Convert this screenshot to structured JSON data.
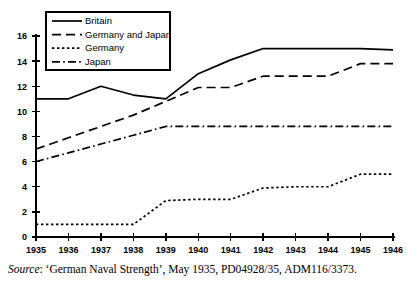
{
  "caption": {
    "source_word": "Source",
    "source_rest": ": ‘German Naval Strength’, May 1935, PD04928/35, ADM116/3373."
  },
  "legend": {
    "position": "top-left-inside",
    "entries": [
      {
        "label": "Britain",
        "style": "solid"
      },
      {
        "label": "Germany and Japan",
        "style": "dashed"
      },
      {
        "label": "Germany",
        "style": "dotted"
      },
      {
        "label": "Japan",
        "style": "dash-dot"
      }
    ]
  },
  "chart_data": {
    "type": "line",
    "title": "",
    "xlabel": "",
    "ylabel": "",
    "grid": false,
    "legend_position": "upper left",
    "x": [
      1935,
      1936,
      1937,
      1938,
      1939,
      1940,
      1941,
      1942,
      1943,
      1944,
      1945,
      1946
    ],
    "xtick_labels": [
      "1935",
      "1936",
      "1937",
      "1938",
      "1939",
      "1940",
      "1941",
      "1942",
      "1943",
      "1944",
      "1945",
      "1946"
    ],
    "ytick_labels": [
      "0",
      "2",
      "4",
      "6",
      "8",
      "10",
      "12",
      "14",
      "16"
    ],
    "yticks": [
      0,
      2,
      4,
      6,
      8,
      10,
      12,
      14,
      16
    ],
    "xlim": [
      1935,
      1946
    ],
    "ylim": [
      0,
      16
    ],
    "series": [
      {
        "name": "Britain",
        "style": "solid",
        "values": [
          11.0,
          11.0,
          12.0,
          11.3,
          11.0,
          13.0,
          14.1,
          15.0,
          15.0,
          15.0,
          15.0,
          14.9
        ]
      },
      {
        "name": "Germany and Japan",
        "style": "dashed",
        "values": [
          7.0,
          7.9,
          8.8,
          9.7,
          10.8,
          11.9,
          11.9,
          12.8,
          12.8,
          12.8,
          13.8,
          13.8
        ]
      },
      {
        "name": "Germany",
        "style": "dotted",
        "values": [
          1.0,
          1.0,
          1.0,
          1.0,
          2.9,
          3.0,
          3.0,
          3.9,
          4.0,
          4.0,
          5.0,
          5.0
        ]
      },
      {
        "name": "Japan",
        "style": "dash-dot",
        "values": [
          6.0,
          6.7,
          7.4,
          8.1,
          8.8,
          8.8,
          8.8,
          8.8,
          8.8,
          8.8,
          8.8,
          8.8
        ]
      }
    ]
  }
}
